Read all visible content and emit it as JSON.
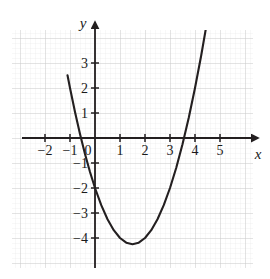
{
  "figure": {
    "name": "parabola-coordinate-graph",
    "background_color": "#ffffff",
    "curve_color": "#231f20",
    "axis_color": "#231f20",
    "major_grid_color": "#c8c8c8",
    "minor_grid_color": "#e6e6e6"
  },
  "axes": {
    "x_axis_label": "x",
    "y_axis_label": "y",
    "x_ticks": [
      {
        "value": -2,
        "label": "−2",
        "px": 45
      },
      {
        "value": -1,
        "label": "−1",
        "px": 70
      },
      {
        "value": 1,
        "label": "1",
        "px": 120
      },
      {
        "value": 2,
        "label": "2",
        "px": 145
      },
      {
        "value": 3,
        "label": "3",
        "px": 170
      },
      {
        "value": 4,
        "label": "4",
        "px": 195
      },
      {
        "value": 5,
        "label": "5",
        "px": 220
      }
    ],
    "y_ticks": [
      {
        "value": 3,
        "label": "3",
        "px": 63
      },
      {
        "value": 2,
        "label": "2",
        "px": 88
      },
      {
        "value": 1,
        "label": "1",
        "px": 113
      },
      {
        "value": -1,
        "label": "−1",
        "px": 163
      },
      {
        "value": -2,
        "label": "−2",
        "px": 188
      },
      {
        "value": -3,
        "label": "−3",
        "px": 213
      },
      {
        "value": -4,
        "label": "−4",
        "px": 238
      }
    ],
    "origin_label": "0"
  },
  "chart_data": {
    "type": "line",
    "title": "",
    "subtitle": "",
    "xlabel": "x",
    "ylabel": "y",
    "grid": true,
    "minor_grid": true,
    "legend": "none",
    "xlim": [
      -2.9,
      6.1
    ],
    "ylim": [
      -5.1,
      4.4
    ],
    "xticks": [
      -2,
      -1,
      0,
      1,
      2,
      3,
      4,
      5
    ],
    "yticks": [
      -4,
      -3,
      -2,
      -1,
      1,
      2,
      3
    ],
    "series": [
      {
        "name": "parabola",
        "equation": "y = x^2 - 3x - 2",
        "vertex": [
          1.5,
          -4.25
        ],
        "y_intercept": -2,
        "x_intercepts": [
          -0.56,
          3.56
        ],
        "x": [
          -1.1,
          -1.0,
          -0.8,
          -0.6,
          -0.4,
          -0.2,
          0.0,
          0.25,
          0.5,
          0.75,
          1.0,
          1.25,
          1.5,
          1.75,
          2.0,
          2.25,
          2.5,
          2.75,
          3.0,
          3.25,
          3.5,
          3.75,
          4.0,
          4.25,
          4.5,
          4.6
        ],
        "y": [
          2.51,
          2.0,
          1.04,
          0.16,
          -0.64,
          -1.36,
          -2.0,
          -2.6875,
          -3.25,
          -3.6875,
          -4.0,
          -4.1875,
          -4.25,
          -4.1875,
          -4.0,
          -3.6875,
          -3.25,
          -2.6875,
          -2.0,
          -1.1875,
          -0.25,
          0.8125,
          2.0,
          3.3125,
          4.75,
          5.36
        ]
      }
    ]
  },
  "geometry": {
    "origin_px": {
      "x": 95,
      "y": 138
    },
    "unit_px": 25,
    "minor_px": 5,
    "plot_box": {
      "left": 12,
      "top": 30,
      "right": 253,
      "bottom": 268
    }
  }
}
